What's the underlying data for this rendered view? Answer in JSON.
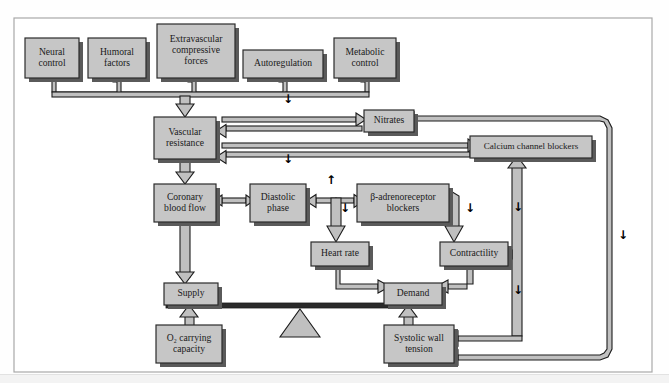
{
  "figure": {
    "kind": "flow-diagram",
    "frame_color": "#9a9a9a",
    "box_fill": "#c6c6c6",
    "box_stroke": "#2b2b2b",
    "arrow_fill": "#bdbdbd",
    "arrow_stroke": "#1e1e1e",
    "shadow_color": "#5a5a5a",
    "page_background": "#ffffff"
  },
  "nodes": [
    {
      "id": "neural",
      "label_line1": "Neural",
      "label_line2": "control",
      "x": 25,
      "y": 38,
      "w": 54,
      "h": 40
    },
    {
      "id": "humoral",
      "label_line1": "Humoral",
      "label_line2": "factors",
      "x": 88,
      "y": 38,
      "w": 58,
      "h": 40
    },
    {
      "id": "extravascular",
      "label_line1": "Extravascular",
      "label_line2": "compressive",
      "label_line3": "forces",
      "x": 157,
      "y": 24,
      "w": 78,
      "h": 54
    },
    {
      "id": "autoreg",
      "label_line1": "Autoregulation",
      "x": 243,
      "y": 50,
      "w": 80,
      "h": 28
    },
    {
      "id": "metabolic",
      "label_line1": "Metabolic",
      "label_line2": "control",
      "x": 334,
      "y": 38,
      "w": 62,
      "h": 40
    },
    {
      "id": "vascular",
      "label_line1": "Vascular",
      "label_line2": "resistance",
      "x": 154,
      "y": 117,
      "w": 62,
      "h": 42
    },
    {
      "id": "nitrates",
      "label_line1": "Nitrates",
      "x": 364,
      "y": 110,
      "w": 50,
      "h": 22
    },
    {
      "id": "calcium",
      "label_line1": "Calcium channel blockers",
      "x": 470,
      "y": 136,
      "w": 122,
      "h": 22
    },
    {
      "id": "coronary",
      "label_line1": "Coronary",
      "label_line2": "blood flow",
      "x": 154,
      "y": 184,
      "w": 62,
      "h": 38
    },
    {
      "id": "diastolic",
      "label_line1": "Diastolic",
      "label_line2": "phase",
      "x": 250,
      "y": 184,
      "w": 56,
      "h": 38
    },
    {
      "id": "betablock",
      "label_line1": "β-adrenoreceptor",
      "label_line2": "blockers",
      "x": 357,
      "y": 184,
      "w": 92,
      "h": 38
    },
    {
      "id": "heartrate",
      "label_line1": "Heart rate",
      "x": 311,
      "y": 242,
      "w": 58,
      "h": 24
    },
    {
      "id": "contractility",
      "label_line1": "Contractility",
      "x": 440,
      "y": 242,
      "w": 68,
      "h": 24
    },
    {
      "id": "supply",
      "label_line1": "Supply",
      "x": 164,
      "y": 283,
      "w": 54,
      "h": 22
    },
    {
      "id": "demand",
      "label_line1": "Demand",
      "x": 384,
      "y": 283,
      "w": 58,
      "h": 22
    },
    {
      "id": "o2carrying",
      "label_line1": "O₂ carrying",
      "label_line2": "capacity",
      "x": 156,
      "y": 325,
      "w": 66,
      "h": 38
    },
    {
      "id": "systolic",
      "label_line1": "Systolic wall",
      "label_line2": "tension",
      "x": 384,
      "y": 325,
      "w": 70,
      "h": 38
    }
  ],
  "glyphs": [
    {
      "id": "arrow-down-vascular-top",
      "symbol": "↓",
      "x": 288,
      "y": 99
    },
    {
      "id": "arrow-down-vascular-bottom",
      "symbol": "↓",
      "x": 288,
      "y": 159
    },
    {
      "id": "arrow-up-diastolic",
      "symbol": "↑",
      "x": 331,
      "y": 180
    },
    {
      "id": "arrow-down-heartrate",
      "symbol": "↓",
      "x": 345,
      "y": 208
    },
    {
      "id": "arrow-down-contractility",
      "symbol": "↓",
      "x": 470,
      "y": 208
    },
    {
      "id": "arrow-down-calcium-mid",
      "symbol": "↓",
      "x": 518,
      "y": 207
    },
    {
      "id": "arrow-down-calcium-low",
      "symbol": "↓",
      "x": 518,
      "y": 290
    },
    {
      "id": "arrow-down-far-right",
      "symbol": "↓",
      "x": 623,
      "y": 235
    }
  ],
  "balance": {
    "beam_label": "supply-demand-beam",
    "fulcrum_label": "fulcrum-triangle",
    "beam_x": 166,
    "beam_y": 303,
    "beam_w": 274,
    "beam_h": 5,
    "fulcrum_cx": 300,
    "fulcrum_y_top": 309,
    "fulcrum_w": 40,
    "fulcrum_h": 28
  },
  "frame": {
    "x": 14,
    "y": 18,
    "w": 638,
    "h": 354
  }
}
